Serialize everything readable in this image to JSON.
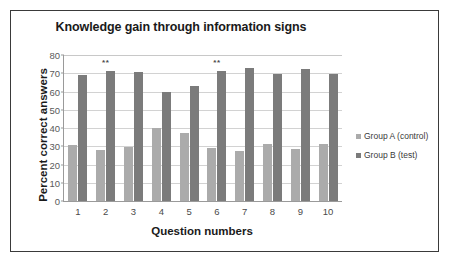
{
  "chart_data": {
    "type": "bar",
    "title": "Knowledge gain through information signs",
    "xlabel": "Question numbers",
    "ylabel": "Percent correct answers",
    "categories": [
      "1",
      "2",
      "3",
      "4",
      "5",
      "6",
      "7",
      "8",
      "9",
      "10"
    ],
    "series": [
      {
        "name": "Group A (control)",
        "color": "#ababab",
        "values": [
          30.5,
          28,
          29.5,
          40,
          37.5,
          29,
          27.5,
          31,
          28.5,
          31.5
        ]
      },
      {
        "name": "Group B (test)",
        "color": "#7b7b7b",
        "values": [
          69,
          71.5,
          70.5,
          60,
          63,
          71,
          73,
          69.5,
          72.5,
          69.5
        ]
      }
    ],
    "ylim": [
      0,
      80
    ],
    "yticks": [
      0,
      10,
      20,
      30,
      40,
      50,
      60,
      70,
      80
    ],
    "ytick_labels": [
      "0",
      "10",
      "20",
      "30",
      "40",
      "50",
      "60",
      "70",
      "80"
    ],
    "grid": true,
    "legend_position": "right",
    "annotations": [
      {
        "text": "**",
        "category": "2",
        "value": 78
      },
      {
        "text": "**",
        "category": "6",
        "value": 78
      }
    ]
  }
}
